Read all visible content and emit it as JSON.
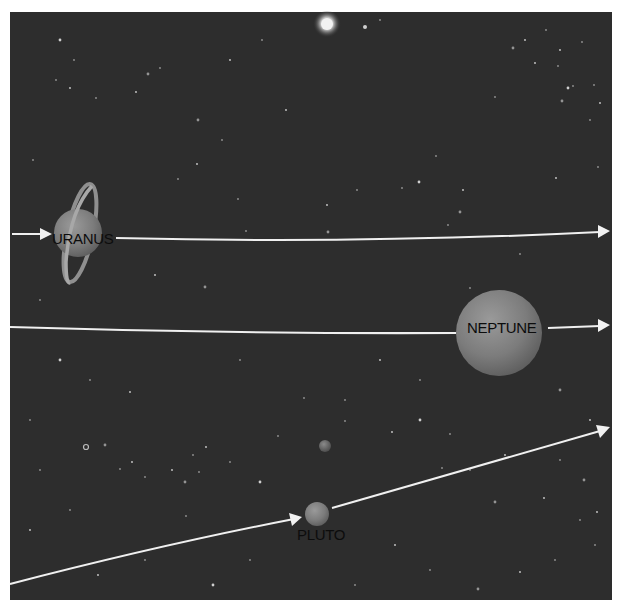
{
  "diagram": {
    "background_color": "#2d2d2d",
    "frame_color": "#ffffff",
    "orbit_color": "#f2f2f2",
    "label_color": "#0c0c0c",
    "sun": {
      "cx": 327,
      "cy": 25,
      "r": 13
    },
    "bodies": [
      {
        "name": "URANUS",
        "label": "URANUS",
        "cx": 78,
        "cy": 233,
        "r": 24,
        "label_x": 52,
        "label_y": 244,
        "ringed": true
      },
      {
        "name": "NEPTUNE",
        "label": "NEPTUNE",
        "cx": 499,
        "cy": 333,
        "r": 43,
        "label_x": 456,
        "label_y": 334,
        "ringed": false
      },
      {
        "name": "PLUTO",
        "label": "PLUTO",
        "cx": 317,
        "cy": 514,
        "r": 12,
        "label_x": 297,
        "label_y": 540,
        "ringed": false
      },
      {
        "name": "CHARON",
        "label": "",
        "cx": 325,
        "cy": 446,
        "r": 6,
        "ringed": false
      }
    ],
    "orbits": [
      {
        "planet": "URANUS",
        "segments": [
          "M12,234 L50,234",
          "M116,238 Q360,244 600,232"
        ],
        "arrowheads": [
          [
            50,
            234,
            0
          ],
          [
            608,
            231,
            -1.5
          ]
        ]
      },
      {
        "planet": "NEPTUNE",
        "segments": [
          "M10,327 Q230,334 456,333",
          "M548,328 L600,326"
        ],
        "arrowheads": [
          [
            608,
            325,
            -1.5
          ]
        ]
      },
      {
        "planet": "PLUTO",
        "segments": [
          "M10,584 Q160,545 300,518",
          "M332,508 Q470,468 600,431"
        ],
        "arrowheads": [
          [
            300,
            518,
            -14
          ],
          [
            608,
            428,
            -19
          ]
        ]
      }
    ]
  }
}
